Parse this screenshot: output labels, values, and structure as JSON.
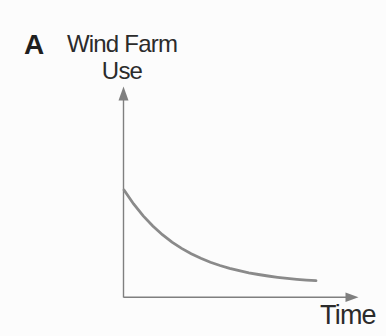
{
  "figure": {
    "panel_label": "A",
    "background": "#fcfcfc",
    "text_color": "#2b2b2b"
  },
  "chart_data": {
    "type": "line",
    "title": "Wind Farm Use",
    "ylabel": "Wind Farm Use",
    "ylabel_lines": [
      "Wind Farm",
      "Use"
    ],
    "xlabel": "Time",
    "xlim": [
      0,
      1
    ],
    "ylim": [
      0,
      1
    ],
    "grid": false,
    "legend": "none",
    "tick_labels": "none",
    "axes": {
      "color": "#7f7f7f",
      "arrows": true
    },
    "series": [
      {
        "name": "wind-farm-use-over-time",
        "shape": "exponential-decay",
        "color": "#8a8a8a",
        "x": [
          0,
          0.05,
          0.1,
          0.15,
          0.2,
          0.25,
          0.3,
          0.35,
          0.4,
          0.45,
          0.5,
          0.55,
          0.6,
          0.65,
          0.7,
          0.75,
          0.8,
          0.85,
          0.9,
          0.95,
          1.0
        ],
        "y": [
          1.0,
          0.87,
          0.759,
          0.665,
          0.584,
          0.515,
          0.457,
          0.407,
          0.365,
          0.328,
          0.298,
          0.271,
          0.249,
          0.23,
          0.214,
          0.2,
          0.188,
          0.178,
          0.169,
          0.162,
          0.156
        ]
      }
    ]
  }
}
